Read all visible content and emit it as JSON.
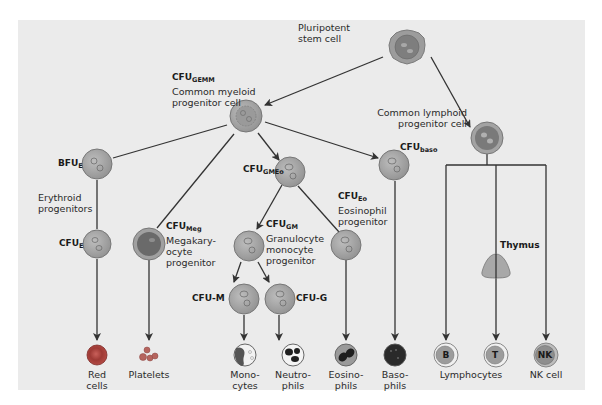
{
  "colors": {
    "background": "#ebebeb",
    "line": "#333333",
    "progenitor_fill": "#a9a9a9",
    "progenitor_edge": "#7e7e7e",
    "nucleus": "#8c8c8c",
    "red_cell": "#b3453f",
    "lymphocyte": "#9a9a9a"
  },
  "nodes": {
    "stem": {
      "lines": [
        "Pluripotent",
        "stem cell"
      ]
    },
    "gemm": {
      "abbr": "CFU",
      "sub": "GEMM",
      "lines": [
        "Common myeloid",
        "progenitor cell"
      ]
    },
    "lymphoid": {
      "lines": [
        "Common lymphoid",
        "progenitor cell"
      ]
    },
    "bfue": {
      "abbr": "BFU",
      "sub": "E"
    },
    "erythroid": {
      "lines": [
        "Erythroid",
        "progenitors"
      ]
    },
    "cfue": {
      "abbr": "CFU",
      "sub": "E"
    },
    "meg": {
      "abbr": "CFU",
      "sub": "Meg",
      "lines": [
        "Megakary-",
        "ocyte",
        "progenitor"
      ]
    },
    "gmeo": {
      "abbr": "CFU",
      "sub": "GMEo"
    },
    "gm": {
      "abbr": "CFU",
      "sub": "GM",
      "lines": [
        "Granulocyte",
        "monocyte",
        "progenitor"
      ]
    },
    "eo": {
      "abbr": "CFU",
      "sub": "Eo",
      "lines": [
        "Eosinophil",
        "progenitor"
      ]
    },
    "baso": {
      "abbr": "CFU",
      "sub": "baso"
    },
    "cfum": {
      "label": "CFU-M"
    },
    "cfug": {
      "label": "CFU-G"
    },
    "thymus": {
      "label": "Thymus"
    }
  },
  "outputs": [
    {
      "id": "red",
      "lines": [
        "Red",
        "cells"
      ]
    },
    {
      "id": "platelets",
      "lines": [
        "Platelets"
      ]
    },
    {
      "id": "mono",
      "lines": [
        "Mono-",
        "cytes"
      ]
    },
    {
      "id": "neutro",
      "lines": [
        "Neutro-",
        "phils"
      ]
    },
    {
      "id": "eosino",
      "lines": [
        "Eosino-",
        "phils"
      ]
    },
    {
      "id": "baso",
      "lines": [
        "Baso-",
        "phils"
      ]
    },
    {
      "id": "lymphocytes",
      "lines": [
        "Lymphocytes"
      ]
    },
    {
      "id": "nk",
      "lines": [
        "NK cell"
      ]
    }
  ],
  "cell_letters": {
    "b": "B",
    "t": "T",
    "nk": "NK"
  }
}
